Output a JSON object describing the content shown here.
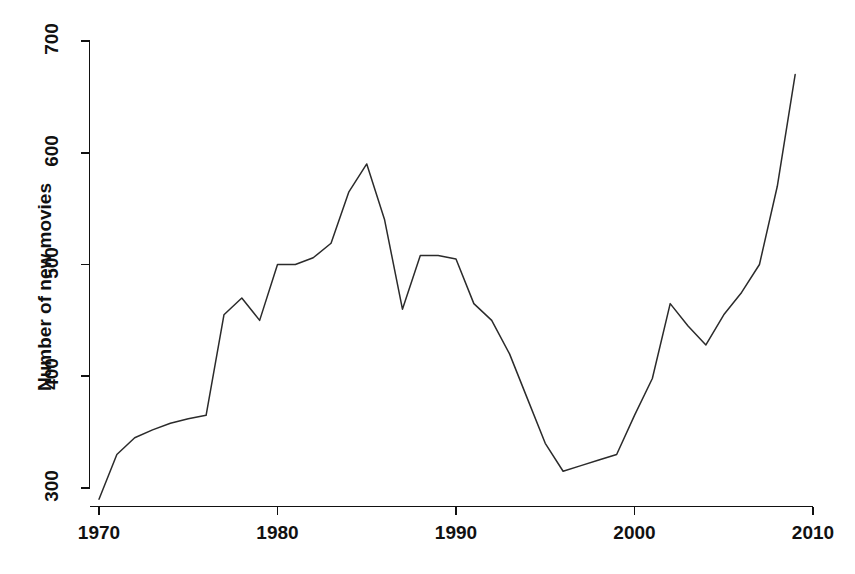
{
  "chart_data": {
    "type": "line",
    "title": "",
    "xlabel": "",
    "ylabel": "Number of new movies",
    "xlim": [
      1969,
      2010.5
    ],
    "ylim": [
      285,
      705
    ],
    "xticks": [
      1970,
      1980,
      1990,
      2000,
      2010
    ],
    "xtick_labels": [
      "1970",
      "1980",
      "1990",
      "2000",
      "2010"
    ],
    "yticks": [
      300,
      400,
      500,
      600,
      700
    ],
    "ytick_labels": [
      "300",
      "400",
      "500",
      "600",
      "700"
    ],
    "grid": false,
    "legend": null,
    "line_color": "#2b2b2b",
    "x": [
      1970,
      1971,
      1972,
      1973,
      1974,
      1975,
      1976,
      1977,
      1978,
      1979,
      1980,
      1981,
      1982,
      1983,
      1984,
      1985,
      1986,
      1987,
      1988,
      1989,
      1990,
      1991,
      1992,
      1993,
      1994,
      1995,
      1996,
      1997,
      1998,
      1999,
      2000,
      2001,
      2002,
      2003,
      2004,
      2005,
      2006,
      2007,
      2008,
      2009
    ],
    "values": [
      290,
      330,
      345,
      352,
      358,
      362,
      365,
      455,
      470,
      450,
      500,
      500,
      506,
      519,
      565,
      590,
      540,
      460,
      508,
      508,
      505,
      465,
      450,
      420,
      380,
      340,
      315,
      320,
      325,
      330,
      365,
      398,
      465,
      445,
      428,
      455,
      475,
      500,
      570,
      670
    ],
    "series": [
      {
        "name": "Number of new movies",
        "values": [
          290,
          330,
          345,
          352,
          358,
          362,
          365,
          455,
          470,
          450,
          500,
          500,
          506,
          519,
          565,
          590,
          540,
          460,
          508,
          508,
          505,
          465,
          450,
          420,
          380,
          340,
          315,
          320,
          325,
          330,
          365,
          398,
          465,
          445,
          428,
          455,
          475,
          500,
          570,
          670
        ]
      }
    ]
  },
  "axis": {
    "y_title": "Number of new movies",
    "y_tick_0": "300",
    "y_tick_1": "400",
    "y_tick_2": "500",
    "y_tick_3": "600",
    "y_tick_4": "700",
    "x_tick_0": "1970",
    "x_tick_1": "1980",
    "x_tick_2": "1990",
    "x_tick_3": "2000",
    "x_tick_4": "2010"
  }
}
